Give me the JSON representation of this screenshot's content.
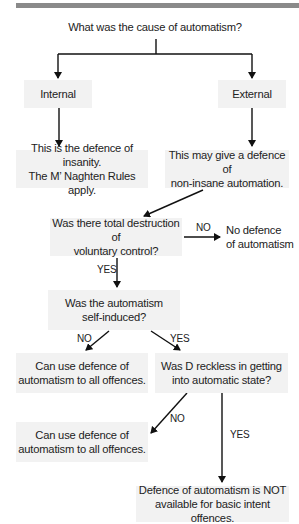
{
  "diagram": {
    "title": "What was the cause of automatism?",
    "nodes": {
      "internal": "Internal",
      "external": "External",
      "insanity": [
        "This is the defence of insanity.",
        "The M’ Naghten Rules apply."
      ],
      "non_insane": [
        "This may give a defence of",
        "non-insane automation."
      ],
      "total_destruction": [
        "Was there total destruction of",
        "voluntary control?"
      ],
      "no_defence": [
        "No defence",
        "of automatism"
      ],
      "self_induced": [
        "Was the automatism",
        "self-induced?"
      ],
      "can_use_1": [
        "Can use defence of",
        "automatism to all offences."
      ],
      "reckless": [
        "Was D reckless in getting",
        "into automatic state?"
      ],
      "can_use_2": [
        "Can use defence of",
        "automatism to all offences."
      ],
      "not_available": [
        "Defence of automatism is NOT",
        "available for basic intent offences."
      ]
    },
    "labels": {
      "no_1": "NO",
      "yes_1": "YES",
      "no_2": "NO",
      "yes_2": "YES",
      "no_3": "NO",
      "yes_3": "YES"
    },
    "colors": {
      "box_fill": "#f2f2f2",
      "line": "#111111",
      "top_bar": "#8a8a8a"
    }
  }
}
